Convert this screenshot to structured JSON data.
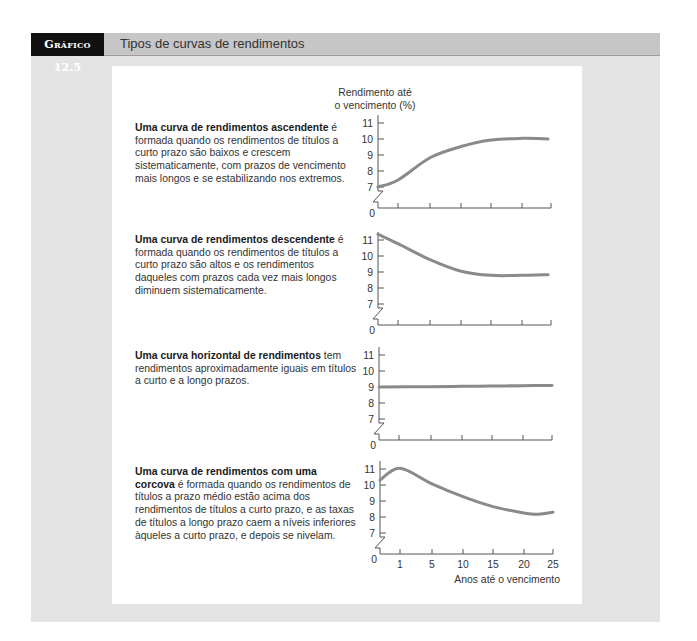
{
  "figure": {
    "label": "Gráfico 12.5",
    "title": "Tipos de curvas de rendimentos",
    "y_axis_title_line1": "Rendimento até",
    "y_axis_title_line2": "o vencimento (%)",
    "x_axis_title": "Anos até o vencimento"
  },
  "descriptions": [
    {
      "bold": "Uma curva de rendimentos ascendente",
      "text": " é\nformada quando os rendimentos de títulos a\ncurto prazo são baixos e crescem\nsistematicamente, com prazos de vencimento\nmais longos e se estabilizando nos extremos."
    },
    {
      "bold": "Uma curva de rendimentos descendente",
      "text": " é\nformada quando os rendimentos de títulos a\ncurto prazo são altos e os rendimentos\ndaqueles com prazos cada vez mais longos\ndiminuem sistematicamente."
    },
    {
      "bold": "Uma curva horizontal de rendimentos",
      "text": " tem\nrendimentos aproximadamente iguais em títulos\na curto e a longo prazos."
    },
    {
      "bold": "Uma curva de rendimentos com uma\ncorcova",
      "text": " é formada quando os rendimentos de\ntítulos a prazo médio estão acima dos\nrendimentos de títulos a curto prazo, e as taxas\nde títulos a longo prazo caem a níveis inferiores\nàqueles a curto prazo, e depois se nivelam."
    }
  ],
  "colors": {
    "curve": "#8a8a8a",
    "axis": "#555555",
    "panel": "#e3e3e3",
    "header_bar": "#c6c6c6",
    "label_bg": "#111111"
  },
  "chart_data": [
    {
      "type": "line",
      "title": "Uma curva de rendimentos ascendente",
      "ylabel": "Rendimento até o vencimento (%)",
      "xlabel": "",
      "y_ticks": [
        7,
        8,
        9,
        10,
        11
      ],
      "y_origin_label": "0",
      "axis_break": true,
      "x_ticks": [
        1,
        5,
        10,
        15,
        20,
        25
      ],
      "x_tick_labels_visible": false,
      "grid": false,
      "x": [
        0,
        1,
        5,
        10,
        15,
        20,
        24.5
      ],
      "values": [
        7.0,
        7.44,
        8.83,
        9.53,
        9.94,
        10.04,
        10.0
      ],
      "ylim": [
        0,
        11
      ]
    },
    {
      "type": "line",
      "title": "Uma curva de rendimentos descendente",
      "ylabel": "Rendimento até o vencimento (%)",
      "xlabel": "",
      "y_ticks": [
        7,
        8,
        9,
        10,
        11
      ],
      "y_origin_label": "0",
      "axis_break": true,
      "x_ticks": [
        1,
        5,
        10,
        15,
        20,
        25
      ],
      "x_tick_labels_visible": false,
      "grid": false,
      "x": [
        0,
        1,
        5,
        10,
        15,
        20,
        24.5
      ],
      "values": [
        11.36,
        10.77,
        9.77,
        9.05,
        8.79,
        8.79,
        8.83
      ],
      "ylim": [
        0,
        11
      ]
    },
    {
      "type": "line",
      "title": "Uma curva horizontal de rendimentos",
      "ylabel": "Rendimento até o vencimento (%)",
      "xlabel": "",
      "y_ticks": [
        7,
        8,
        9,
        10,
        11
      ],
      "y_origin_label": "0",
      "axis_break": true,
      "x_ticks": [
        1,
        5,
        10,
        15,
        20,
        25
      ],
      "x_tick_labels_visible": false,
      "grid": false,
      "x": [
        0,
        5,
        10,
        15,
        20,
        25
      ],
      "values": [
        9.0,
        9.02,
        9.04,
        9.06,
        9.08,
        9.1
      ],
      "ylim": [
        0,
        11
      ]
    },
    {
      "type": "line",
      "title": "Uma curva de rendimentos com uma corcova",
      "ylabel": "Rendimento até o vencimento (%)",
      "xlabel": "Anos até o vencimento",
      "y_ticks": [
        7,
        8,
        9,
        10,
        11
      ],
      "y_origin_label": "0",
      "axis_break": true,
      "x_ticks": [
        1,
        5,
        10,
        15,
        20,
        25
      ],
      "x_tick_labels_visible": true,
      "grid": false,
      "x": [
        0,
        1,
        5,
        10,
        15,
        20,
        22,
        25
      ],
      "values": [
        10.3,
        11.05,
        10.07,
        9.27,
        8.65,
        8.25,
        8.17,
        8.3
      ],
      "ylim": [
        0,
        11
      ]
    }
  ]
}
